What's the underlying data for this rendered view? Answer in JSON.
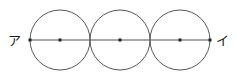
{
  "figure": {
    "canvas": {
      "width": 237,
      "height": 76
    },
    "colors": {
      "background": "#ffffff",
      "stroke": "#555555",
      "line": "#555555",
      "dot": "#222222",
      "label": "#1a1a1a"
    },
    "stroke_width": 1,
    "labels": {
      "left": "ア",
      "right": "イ"
    },
    "label_positions": {
      "left": {
        "x": 8,
        "y": 40
      },
      "right": {
        "x": 216,
        "y": 40
      }
    },
    "segment": {
      "name": "アイ",
      "start": {
        "x": 30,
        "y": 40
      },
      "end": {
        "x": 210,
        "y": 40
      }
    },
    "circles": [
      {
        "name": "circle-1",
        "cx": 60,
        "cy": 40,
        "r": 30
      },
      {
        "name": "circle-2",
        "cx": 120,
        "cy": 40,
        "r": 30
      },
      {
        "name": "circle-3",
        "cx": 180,
        "cy": 40,
        "r": 30
      }
    ],
    "dots": [
      {
        "name": "endpoint-dot-left",
        "x": 30,
        "y": 40,
        "size": 3
      },
      {
        "name": "center-dot-1",
        "x": 60,
        "y": 40,
        "size": 3
      },
      {
        "name": "center-dot-2",
        "x": 120,
        "y": 40,
        "size": 3
      },
      {
        "name": "center-dot-3",
        "x": 180,
        "y": 40,
        "size": 3
      },
      {
        "name": "endpoint-dot-right",
        "x": 210,
        "y": 40,
        "size": 3
      }
    ]
  }
}
